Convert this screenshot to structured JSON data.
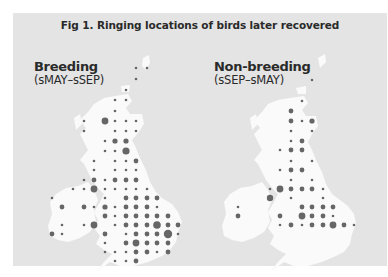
{
  "chart_data": [
    {
      "type": "scatter",
      "title": "Fig 1. Ringing locations of birds later recovered",
      "panel": "Breeding",
      "subtitle": "(sMAY–sSEP)",
      "description": "Proportional-symbol map of Britain & Ireland; dot size = relative number of ringed birds later recovered per grid square",
      "size_scale": {
        "small": 1.2,
        "medium": 2.4,
        "large": 3.4,
        "xlarge": 4.4
      },
      "points": [
        {
          "x": 136,
          "y": 68,
          "r": 1.3
        },
        {
          "x": 147,
          "y": 68,
          "r": 1.3
        },
        {
          "x": 136,
          "y": 79,
          "r": 1.3
        },
        {
          "x": 126,
          "y": 90,
          "r": 1.3
        },
        {
          "x": 115,
          "y": 100,
          "r": 1.3
        },
        {
          "x": 126,
          "y": 100,
          "r": 1.3
        },
        {
          "x": 115,
          "y": 111,
          "r": 1.3
        },
        {
          "x": 84,
          "y": 121,
          "r": 1.3
        },
        {
          "x": 105,
          "y": 121,
          "r": 3.4
        },
        {
          "x": 115,
          "y": 121,
          "r": 1.3
        },
        {
          "x": 126,
          "y": 121,
          "r": 1.3
        },
        {
          "x": 136,
          "y": 121,
          "r": 1.3
        },
        {
          "x": 84,
          "y": 131,
          "r": 1.3
        },
        {
          "x": 115,
          "y": 131,
          "r": 1.3
        },
        {
          "x": 126,
          "y": 131,
          "r": 1.3
        },
        {
          "x": 136,
          "y": 131,
          "r": 1.3
        },
        {
          "x": 105,
          "y": 141,
          "r": 1.3
        },
        {
          "x": 115,
          "y": 141,
          "r": 2.6
        },
        {
          "x": 126,
          "y": 141,
          "r": 2.6
        },
        {
          "x": 105,
          "y": 151,
          "r": 1.3
        },
        {
          "x": 115,
          "y": 151,
          "r": 1.3
        },
        {
          "x": 126,
          "y": 151,
          "r": 3.6
        },
        {
          "x": 94,
          "y": 161,
          "r": 1.3
        },
        {
          "x": 115,
          "y": 161,
          "r": 1.3
        },
        {
          "x": 126,
          "y": 161,
          "r": 1.3
        },
        {
          "x": 136,
          "y": 161,
          "r": 2.4
        },
        {
          "x": 94,
          "y": 170,
          "r": 1.3
        },
        {
          "x": 115,
          "y": 170,
          "r": 1.3
        },
        {
          "x": 126,
          "y": 170,
          "r": 1.3
        },
        {
          "x": 136,
          "y": 170,
          "r": 1.3
        },
        {
          "x": 84,
          "y": 180,
          "r": 1.3
        },
        {
          "x": 94,
          "y": 180,
          "r": 2.4
        },
        {
          "x": 105,
          "y": 180,
          "r": 1.3
        },
        {
          "x": 115,
          "y": 180,
          "r": 2.4
        },
        {
          "x": 126,
          "y": 180,
          "r": 2.4
        },
        {
          "x": 136,
          "y": 180,
          "r": 2.4
        },
        {
          "x": 73,
          "y": 189,
          "r": 1.3
        },
        {
          "x": 84,
          "y": 189,
          "r": 1.3
        },
        {
          "x": 94,
          "y": 189,
          "r": 3.4
        },
        {
          "x": 105,
          "y": 189,
          "r": 1.3
        },
        {
          "x": 115,
          "y": 189,
          "r": 1.3
        },
        {
          "x": 126,
          "y": 189,
          "r": 1.3
        },
        {
          "x": 136,
          "y": 189,
          "r": 1.3
        },
        {
          "x": 147,
          "y": 189,
          "r": 1.3
        },
        {
          "x": 52,
          "y": 198,
          "r": 1.3
        },
        {
          "x": 105,
          "y": 198,
          "r": 1.3
        },
        {
          "x": 126,
          "y": 198,
          "r": 2.4
        },
        {
          "x": 136,
          "y": 198,
          "r": 2.4
        },
        {
          "x": 147,
          "y": 198,
          "r": 2.4
        },
        {
          "x": 157,
          "y": 198,
          "r": 2.4
        },
        {
          "x": 62,
          "y": 207,
          "r": 2.4
        },
        {
          "x": 84,
          "y": 207,
          "r": 2.4
        },
        {
          "x": 94,
          "y": 207,
          "r": 1.3
        },
        {
          "x": 105,
          "y": 207,
          "r": 2.6
        },
        {
          "x": 115,
          "y": 207,
          "r": 1.3
        },
        {
          "x": 126,
          "y": 207,
          "r": 2.4
        },
        {
          "x": 136,
          "y": 207,
          "r": 2.4
        },
        {
          "x": 147,
          "y": 207,
          "r": 2.4
        },
        {
          "x": 157,
          "y": 207,
          "r": 1.3
        },
        {
          "x": 105,
          "y": 216,
          "r": 2.4
        },
        {
          "x": 115,
          "y": 216,
          "r": 1.3
        },
        {
          "x": 126,
          "y": 216,
          "r": 2.4
        },
        {
          "x": 136,
          "y": 216,
          "r": 2.4
        },
        {
          "x": 147,
          "y": 216,
          "r": 2.4
        },
        {
          "x": 157,
          "y": 216,
          "r": 2.4
        },
        {
          "x": 168,
          "y": 216,
          "r": 2.4
        },
        {
          "x": 62,
          "y": 225,
          "r": 1.3
        },
        {
          "x": 84,
          "y": 225,
          "r": 1.3
        },
        {
          "x": 94,
          "y": 225,
          "r": 3.4
        },
        {
          "x": 115,
          "y": 225,
          "r": 1.3
        },
        {
          "x": 126,
          "y": 225,
          "r": 2.4
        },
        {
          "x": 136,
          "y": 225,
          "r": 2.4
        },
        {
          "x": 147,
          "y": 225,
          "r": 2.4
        },
        {
          "x": 157,
          "y": 225,
          "r": 3.8
        },
        {
          "x": 168,
          "y": 225,
          "r": 2.4
        },
        {
          "x": 178,
          "y": 225,
          "r": 2.4
        },
        {
          "x": 52,
          "y": 234,
          "r": 2.4
        },
        {
          "x": 62,
          "y": 234,
          "r": 1.3
        },
        {
          "x": 105,
          "y": 234,
          "r": 2.4
        },
        {
          "x": 126,
          "y": 234,
          "r": 1.3
        },
        {
          "x": 136,
          "y": 234,
          "r": 2.4
        },
        {
          "x": 147,
          "y": 234,
          "r": 2.4
        },
        {
          "x": 157,
          "y": 234,
          "r": 2.4
        },
        {
          "x": 168,
          "y": 234,
          "r": 4.2
        },
        {
          "x": 178,
          "y": 234,
          "r": 1.3
        },
        {
          "x": 105,
          "y": 243,
          "r": 1.3
        },
        {
          "x": 126,
          "y": 243,
          "r": 2.4
        },
        {
          "x": 136,
          "y": 243,
          "r": 3.4
        },
        {
          "x": 147,
          "y": 243,
          "r": 2.4
        },
        {
          "x": 157,
          "y": 243,
          "r": 2.4
        },
        {
          "x": 168,
          "y": 243,
          "r": 2.4
        },
        {
          "x": 105,
          "y": 252,
          "r": 1.3
        },
        {
          "x": 115,
          "y": 252,
          "r": 1.3
        },
        {
          "x": 126,
          "y": 252,
          "r": 1.3
        },
        {
          "x": 136,
          "y": 252,
          "r": 2.4
        },
        {
          "x": 147,
          "y": 252,
          "r": 2.4
        },
        {
          "x": 157,
          "y": 252,
          "r": 1.3
        },
        {
          "x": 168,
          "y": 252,
          "r": 2.4
        },
        {
          "x": 115,
          "y": 261,
          "r": 1.3
        },
        {
          "x": 126,
          "y": 261,
          "r": 1.3
        },
        {
          "x": 136,
          "y": 261,
          "r": 2.4
        }
      ]
    },
    {
      "type": "scatter",
      "title": "Fig 1. Ringing locations of birds later recovered",
      "panel": "Non-breeding",
      "subtitle": "(sSEP–sMAY)",
      "description": "Proportional-symbol map of Britain & Ireland; dot size = relative number of ringed birds later recovered per grid square",
      "points": [
        {
          "x": 312,
          "y": 80,
          "r": 1.3
        },
        {
          "x": 302,
          "y": 101,
          "r": 1.3
        },
        {
          "x": 291,
          "y": 111,
          "r": 2.4
        },
        {
          "x": 291,
          "y": 121,
          "r": 2.4
        },
        {
          "x": 302,
          "y": 121,
          "r": 1.3
        },
        {
          "x": 312,
          "y": 121,
          "r": 2.6
        },
        {
          "x": 291,
          "y": 131,
          "r": 1.3
        },
        {
          "x": 312,
          "y": 131,
          "r": 1.3
        },
        {
          "x": 291,
          "y": 141,
          "r": 1.3
        },
        {
          "x": 302,
          "y": 141,
          "r": 2.4
        },
        {
          "x": 280,
          "y": 150,
          "r": 1.3
        },
        {
          "x": 291,
          "y": 150,
          "r": 2.4
        },
        {
          "x": 302,
          "y": 150,
          "r": 2.4
        },
        {
          "x": 291,
          "y": 161,
          "r": 1.3
        },
        {
          "x": 312,
          "y": 161,
          "r": 1.3
        },
        {
          "x": 280,
          "y": 170,
          "r": 1.3
        },
        {
          "x": 291,
          "y": 170,
          "r": 2.4
        },
        {
          "x": 302,
          "y": 170,
          "r": 2.4
        },
        {
          "x": 291,
          "y": 180,
          "r": 1.3
        },
        {
          "x": 312,
          "y": 180,
          "r": 1.3
        },
        {
          "x": 270,
          "y": 189,
          "r": 1.3
        },
        {
          "x": 280,
          "y": 189,
          "r": 3.4
        },
        {
          "x": 291,
          "y": 189,
          "r": 2.4
        },
        {
          "x": 302,
          "y": 189,
          "r": 2.4
        },
        {
          "x": 312,
          "y": 189,
          "r": 2.4
        },
        {
          "x": 323,
          "y": 189,
          "r": 1.3
        },
        {
          "x": 270,
          "y": 198,
          "r": 3.2
        },
        {
          "x": 291,
          "y": 198,
          "r": 1.3
        },
        {
          "x": 323,
          "y": 198,
          "r": 1.3
        },
        {
          "x": 238,
          "y": 207,
          "r": 1.3
        },
        {
          "x": 302,
          "y": 207,
          "r": 2.4
        },
        {
          "x": 312,
          "y": 207,
          "r": 2.4
        },
        {
          "x": 323,
          "y": 207,
          "r": 2.4
        },
        {
          "x": 333,
          "y": 207,
          "r": 2.4
        },
        {
          "x": 238,
          "y": 216,
          "r": 2.4
        },
        {
          "x": 280,
          "y": 216,
          "r": 2.4
        },
        {
          "x": 302,
          "y": 216,
          "r": 3.4
        },
        {
          "x": 312,
          "y": 216,
          "r": 2.4
        },
        {
          "x": 323,
          "y": 216,
          "r": 2.4
        },
        {
          "x": 333,
          "y": 216,
          "r": 1.3
        },
        {
          "x": 280,
          "y": 225,
          "r": 1.3
        },
        {
          "x": 291,
          "y": 225,
          "r": 2.4
        },
        {
          "x": 302,
          "y": 225,
          "r": 1.3
        },
        {
          "x": 312,
          "y": 225,
          "r": 2.4
        },
        {
          "x": 323,
          "y": 225,
          "r": 2.4
        },
        {
          "x": 333,
          "y": 225,
          "r": 3.4
        },
        {
          "x": 344,
          "y": 225,
          "r": 2.4
        },
        {
          "x": 354,
          "y": 225,
          "r": 1.3
        },
        {
          "x": 238,
          "y": 216,
          "r": 1.3
        },
        {
          "x": 238,
          "y": 216,
          "r": 1.3
        },
        {
          "x": 238,
          "y": 216,
          "r": 1.3
        }
      ]
    }
  ],
  "figure": {
    "title": "Fig 1. Ringing locations of birds later recovered",
    "maps": [
      {
        "heading": "Breeding",
        "subheading": "(sMAY–sSEP)"
      },
      {
        "heading": "Non-breeding",
        "subheading": "(sSEP–sMAY)"
      }
    ]
  },
  "colors": {
    "panel_bg": "#e4e4e4",
    "land": "#fafafa",
    "dots": "#666666",
    "text": "#2a2a2a"
  }
}
